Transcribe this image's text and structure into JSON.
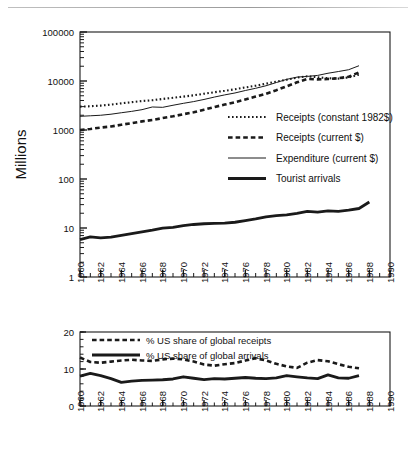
{
  "figure": {
    "panels": 2,
    "background": "#ffffff",
    "line_color": "#1a1a1a"
  },
  "chart_data": [
    {
      "type": "line",
      "id": "top-panel",
      "title": "",
      "xlabel": "",
      "ylabel": "Millions",
      "yscale": "log",
      "ylim": [
        1,
        100000
      ],
      "ytick_labels": [
        "1",
        "10",
        "100",
        "1000",
        "10000",
        "100000"
      ],
      "ytick_values": [
        1,
        10,
        100,
        1000,
        10000,
        100000
      ],
      "xlim": [
        1960,
        1990
      ],
      "xtick_labels": [
        "1960",
        "1962",
        "1964",
        "1966",
        "1968",
        "1970",
        "1972",
        "1974",
        "1976",
        "1978",
        "1980",
        "1982",
        "1984",
        "1986",
        "1988",
        "1990"
      ],
      "xtick_values": [
        1960,
        1962,
        1964,
        1966,
        1968,
        1970,
        1972,
        1974,
        1976,
        1978,
        1980,
        1982,
        1984,
        1986,
        1988,
        1990
      ],
      "grid": false,
      "legend_position": "center-right",
      "x": [
        1960,
        1961,
        1962,
        1963,
        1964,
        1965,
        1966,
        1967,
        1968,
        1969,
        1970,
        1971,
        1972,
        1973,
        1974,
        1975,
        1976,
        1977,
        1978,
        1979,
        1980,
        1981,
        1982,
        1983,
        1984,
        1985,
        1986,
        1987,
        1988
      ],
      "series": [
        {
          "name": "Receipts  (constant 1982$)",
          "style": "dotted",
          "values": [
            3000,
            3050,
            3150,
            3300,
            3500,
            3700,
            3900,
            4050,
            4300,
            4550,
            4800,
            5100,
            5500,
            5900,
            6300,
            6800,
            7400,
            8000,
            8800,
            9700,
            10600,
            11700,
            12500,
            11900,
            11400,
            11200,
            11800,
            13500,
            null
          ]
        },
        {
          "name": "Receipts  (current $)",
          "style": "dashed",
          "values": [
            1000,
            1050,
            1120,
            1180,
            1280,
            1380,
            1500,
            1600,
            1750,
            1900,
            2100,
            2300,
            2600,
            2950,
            3300,
            3700,
            4200,
            4800,
            5500,
            6500,
            7800,
            9400,
            11000,
            10800,
            11000,
            11400,
            12200,
            15000,
            null
          ]
        },
        {
          "name": "Expenditure  (current $)",
          "style": "thin-solid",
          "values": [
            1900,
            1950,
            2000,
            2100,
            2250,
            2400,
            2600,
            2950,
            2900,
            3200,
            3500,
            3800,
            4200,
            4700,
            5200,
            5700,
            6400,
            7100,
            8000,
            9300,
            10800,
            12000,
            12400,
            13000,
            14400,
            15600,
            17000,
            20500,
            null
          ]
        },
        {
          "name": "Tourist  arrivals",
          "style": "thick-solid",
          "values": [
            5.8,
            6.6,
            6.3,
            6.5,
            7.1,
            7.7,
            8.3,
            9.0,
            9.9,
            10.3,
            11.2,
            11.8,
            12.2,
            12.4,
            12.6,
            13.1,
            14.1,
            15.3,
            16.9,
            17.9,
            18.5,
            19.9,
            21.9,
            21.0,
            22.3,
            21.9,
            23.1,
            25.0,
            34.0
          ]
        }
      ]
    },
    {
      "type": "line",
      "id": "bottom-panel",
      "title": "",
      "xlabel": "",
      "ylabel": "",
      "yscale": "linear",
      "ylim": [
        0,
        20
      ],
      "ytick_labels": [
        "0",
        "10",
        "20"
      ],
      "ytick_values": [
        0,
        10,
        20
      ],
      "xlim": [
        1960,
        1990
      ],
      "xtick_labels": [
        "1960",
        "1962",
        "1964",
        "1966",
        "1968",
        "1970",
        "1972",
        "1974",
        "1976",
        "1978",
        "1980",
        "1982",
        "1984",
        "1986",
        "1988",
        "1990"
      ],
      "xtick_values": [
        1960,
        1962,
        1964,
        1966,
        1968,
        1970,
        1972,
        1974,
        1976,
        1978,
        1980,
        1982,
        1984,
        1986,
        1988,
        1990
      ],
      "grid": false,
      "legend_position": "top-center",
      "x": [
        1960,
        1961,
        1962,
        1963,
        1964,
        1965,
        1966,
        1967,
        1968,
        1969,
        1970,
        1971,
        1972,
        1973,
        1974,
        1975,
        1976,
        1977,
        1978,
        1979,
        1980,
        1981,
        1982,
        1983,
        1984,
        1985,
        1986,
        1987
      ],
      "series": [
        {
          "name": "% US share of global receipts",
          "style": "dashed",
          "values": [
            13.1,
            11.9,
            11.7,
            12.0,
            12.3,
            12.5,
            12.3,
            12.2,
            12.6,
            12.8,
            12.6,
            12.0,
            11.2,
            10.9,
            11.3,
            11.6,
            12.3,
            12.9,
            12.3,
            11.4,
            10.7,
            10.3,
            11.7,
            12.4,
            12.1,
            11.3,
            10.6,
            10.2
          ]
        },
        {
          "name": "% US share of global arrivals",
          "style": "thick-solid",
          "values": [
            8.1,
            8.8,
            8.2,
            7.4,
            6.4,
            6.7,
            6.9,
            7.0,
            7.1,
            7.3,
            7.9,
            7.5,
            7.1,
            7.4,
            7.3,
            7.5,
            7.7,
            7.5,
            7.4,
            7.6,
            8.2,
            7.9,
            7.6,
            7.4,
            8.4,
            7.6,
            7.5,
            8.2
          ]
        }
      ]
    }
  ],
  "top_legend": {
    "items": [
      {
        "label": "Receipts  (constant 1982$)",
        "style": "dotted"
      },
      {
        "label": "Receipts  (current $)",
        "style": "dashed"
      },
      {
        "label": "Expenditure  (current $)",
        "style": "thin-solid"
      },
      {
        "label": "Tourist  arrivals",
        "style": "thick-solid"
      }
    ]
  },
  "bottom_legend": {
    "items": [
      {
        "label": "% US share of global receipts",
        "style": "dashed"
      },
      {
        "label": "% US share of global arrivals",
        "style": "thick-solid"
      }
    ]
  },
  "axis_titles": {
    "top_y": "Millions"
  }
}
